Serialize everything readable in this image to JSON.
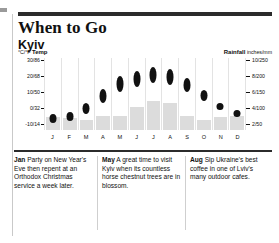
{
  "header": {
    "title": "When to Go",
    "subtitle": "Kyiv"
  },
  "axes": {
    "left_caption_unit": "°C/°F",
    "left_caption_label": "Temp",
    "right_caption_label": "Rainfall",
    "right_caption_unit": "inches/mm",
    "left_ticks": [
      "30/86",
      "20/68",
      "10/50",
      "0/32",
      "-10/14"
    ],
    "right_ticks": [
      "10/250",
      "8/200",
      "6/150",
      "4/100",
      "2/50"
    ]
  },
  "chart_data": {
    "type": "bar",
    "xlabel": "",
    "ylabel": "Temp",
    "categories": [
      "J",
      "F",
      "M",
      "A",
      "M",
      "J",
      "J",
      "A",
      "S",
      "O",
      "N",
      "D"
    ],
    "month_labels": [
      "J",
      "F",
      "M",
      "A",
      "M",
      "J",
      "J",
      "A",
      "S",
      "O",
      "N",
      "D"
    ],
    "grid": true,
    "legend_position": "none",
    "ylim": [
      -10,
      30
    ],
    "ylim_f": [
      14,
      86
    ],
    "y2lim": [
      0,
      10
    ],
    "y2lim_mm": [
      0,
      250
    ],
    "series": [
      {
        "name": "Temp",
        "unit": "°C",
        "type": "range-marker",
        "axis": "left",
        "color": "#111111",
        "low": [
          -6,
          -5,
          -1,
          5,
          11,
          14,
          16,
          15,
          11,
          6,
          1,
          -3
        ],
        "high": [
          -1,
          0,
          5,
          13,
          20,
          23,
          25,
          24,
          19,
          12,
          5,
          1
        ]
      },
      {
        "name": "Rainfall",
        "unit": "inches",
        "type": "bar",
        "axis": "right",
        "color": "#dcdcdc",
        "values": [
          1.8,
          1.6,
          1.4,
          2.0,
          2.0,
          3.2,
          4.0,
          3.8,
          2.0,
          1.4,
          1.8,
          2.0
        ],
        "values_mm": [
          45,
          40,
          35,
          50,
          50,
          80,
          100,
          95,
          50,
          35,
          45,
          50
        ]
      }
    ]
  },
  "notes": [
    {
      "month": "Jan",
      "text": " Party on New Year's Eve then repent at an Orthodox Christmas service a week later."
    },
    {
      "month": "May",
      "text": " A great time to visit Kyiv when its countless horse chestnut trees are in blossom."
    },
    {
      "month": "Aug",
      "text": " Sip Ukraine's best coffee in one of Lviv's many outdoor cafes."
    }
  ],
  "colors": {
    "temp": "#111111",
    "rain": "#dcdcdc",
    "rule": "#2b2b2b",
    "grid": "#e3e3e3"
  }
}
